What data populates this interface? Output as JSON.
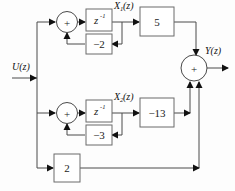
{
  "diagram": {
    "type": "block-diagram",
    "background_color": "#fdfdfd",
    "line_color": "#4a4a4a",
    "box_stroke_color": "#6b6b6b",
    "text_color": "#1b1b1b",
    "signals": {
      "input": "U(z)",
      "output": "Y(z)",
      "state_1_base": "X",
      "state_1_sub": "1",
      "state_1_tail": "(z)",
      "state_2_base": "X",
      "state_2_sub": "2",
      "state_2_tail": "(z)"
    },
    "delay_blocks": [
      {
        "id": "delay-top",
        "base": "z",
        "exponent": "-1"
      },
      {
        "id": "delay-bottom",
        "base": "z",
        "exponent": "-1"
      }
    ],
    "gain_blocks": [
      {
        "id": "gain-feedback-top",
        "label": "−2"
      },
      {
        "id": "gain-forward-top",
        "label": "5"
      },
      {
        "id": "gain-feedback-bottom",
        "label": "−3"
      },
      {
        "id": "gain-forward-bottom",
        "label": "−13"
      },
      {
        "id": "gain-feedthrough",
        "label": "2"
      }
    ],
    "summers": [
      {
        "id": "summer-top",
        "label": "+"
      },
      {
        "id": "summer-bottom",
        "label": "+"
      },
      {
        "id": "summer-output",
        "label": "+"
      }
    ]
  }
}
